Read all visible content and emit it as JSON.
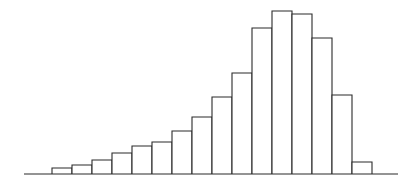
{
  "figure": {
    "width": 420,
    "height": 186,
    "background": "#ffffff",
    "ink_color": "#2b2b2b",
    "title": "",
    "has_axis_labels": false,
    "has_tick_labels": false,
    "has_legend": false,
    "has_gridlines": false
  },
  "axis": {
    "baseline_y": 174,
    "baseline_x_start": 24,
    "baseline_x_end": 398,
    "stroke": "#2b2b2b",
    "stroke_width": 1.1
  },
  "chart_data": {
    "type": "bar",
    "title": "",
    "subtitle": "",
    "xlabel": "",
    "ylabel": "",
    "grid": false,
    "legend_position": "none",
    "orientation": "vertical",
    "bar_style": "outline",
    "bar_fill": "#ffffff",
    "bar_stroke": "#2b2b2b",
    "bar_count": 16,
    "bar_width_px": 20,
    "plot_left_px": 52,
    "plot_baseline_px": 174,
    "xlim": [
      0,
      16
    ],
    "ylim": [
      0,
      170
    ],
    "categories": [
      "1",
      "2",
      "3",
      "4",
      "5",
      "6",
      "7",
      "8",
      "9",
      "10",
      "11",
      "12",
      "13",
      "14",
      "15",
      "16"
    ],
    "tick_labels": [],
    "values": [
      6,
      9,
      14,
      21,
      28,
      32,
      43,
      57,
      77,
      101,
      146,
      163,
      160,
      136,
      79,
      12
    ],
    "annotations": [],
    "bars": [
      {
        "index": 1,
        "x_left": 52,
        "x_right": 72,
        "top_y": 168,
        "height": 6
      },
      {
        "index": 2,
        "x_left": 72,
        "x_right": 92,
        "top_y": 165,
        "height": 9
      },
      {
        "index": 3,
        "x_left": 92,
        "x_right": 112,
        "top_y": 160,
        "height": 14
      },
      {
        "index": 4,
        "x_left": 112,
        "x_right": 132,
        "top_y": 153,
        "height": 21
      },
      {
        "index": 5,
        "x_left": 132,
        "x_right": 152,
        "top_y": 146,
        "height": 28
      },
      {
        "index": 6,
        "x_left": 152,
        "x_right": 172,
        "top_y": 142,
        "height": 32
      },
      {
        "index": 7,
        "x_left": 172,
        "x_right": 192,
        "top_y": 131,
        "height": 43
      },
      {
        "index": 8,
        "x_left": 192,
        "x_right": 212,
        "top_y": 117,
        "height": 57
      },
      {
        "index": 9,
        "x_left": 212,
        "x_right": 232,
        "top_y": 97,
        "height": 77
      },
      {
        "index": 10,
        "x_left": 232,
        "x_right": 252,
        "top_y": 73,
        "height": 101
      },
      {
        "index": 11,
        "x_left": 252,
        "x_right": 272,
        "top_y": 28,
        "height": 146
      },
      {
        "index": 12,
        "x_left": 272,
        "x_right": 292,
        "top_y": 11,
        "height": 163
      },
      {
        "index": 13,
        "x_left": 292,
        "x_right": 312,
        "top_y": 14,
        "height": 160
      },
      {
        "index": 14,
        "x_left": 312,
        "x_right": 332,
        "top_y": 38,
        "height": 136
      },
      {
        "index": 15,
        "x_left": 332,
        "x_right": 352,
        "top_y": 95,
        "height": 79
      },
      {
        "index": 16,
        "x_left": 352,
        "x_right": 372,
        "top_y": 162,
        "height": 12
      }
    ]
  }
}
